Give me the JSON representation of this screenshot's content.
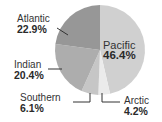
{
  "chart_data": {
    "type": "pie",
    "title": "",
    "categories": [
      "Pacific",
      "Arctic",
      "Southern",
      "Indian",
      "Atlantic"
    ],
    "values": [
      46.4,
      4.2,
      6.1,
      20.4,
      22.9
    ],
    "labels": [
      "46.4%",
      "4.2%",
      "6.1%",
      "20.4%",
      "22.9%"
    ],
    "colors": [
      "#d0d0d0",
      "#ebebeb",
      "#c6c6c6",
      "#adadad",
      "#979797"
    ],
    "start_angle": "12 o'clock",
    "direction": "clockwise",
    "legend": "none (direct labels)"
  }
}
